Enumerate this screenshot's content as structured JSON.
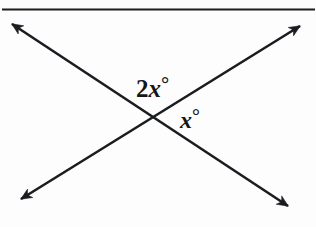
{
  "figure": {
    "background_color": "#fdfdfd",
    "stroke_color": "#1a1c20",
    "top_rule": {
      "name": "top-horizontal-rule",
      "x1": 2,
      "y1": 9.5,
      "x2": 315,
      "y2": 9.5,
      "stroke_width": 2.1
    },
    "lines": [
      {
        "name": "line-northwest-southeast",
        "description": "double-headed arrow running from upper-left down to lower-right",
        "from": {
          "x": 12,
          "y": 24
        },
        "to": {
          "x": 288,
          "y": 206
        },
        "stroke_width": 2.6,
        "arrow_start": true,
        "arrow_end": true
      },
      {
        "name": "line-southwest-northeast",
        "description": "double-headed arrow running from lower-left up to upper-right",
        "from": {
          "x": 21,
          "y": 199
        },
        "to": {
          "x": 300,
          "y": 26
        },
        "stroke_width": 2.6,
        "arrow_start": true,
        "arrow_end": true
      }
    ],
    "intersection": {
      "name": "intersection-point",
      "x": 152,
      "y": 119
    },
    "labels": [
      {
        "name": "angle-label-2x",
        "coefficient": "2",
        "variable": "x",
        "degree_symbol": "°",
        "full_text": "2x°",
        "x": 136,
        "y": 74
      },
      {
        "name": "angle-label-x",
        "coefficient": "",
        "variable": "x",
        "degree_symbol": "°",
        "full_text": "x°",
        "x": 180,
        "y": 106
      }
    ]
  }
}
